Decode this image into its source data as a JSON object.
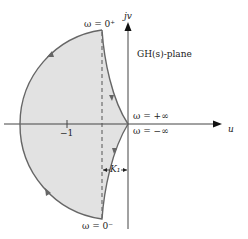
{
  "diagram": {
    "plane_label": "GH(s)-plane",
    "axis_imag_label": "jv",
    "axis_real_label": "u",
    "tick_label": "−1",
    "omega_top": "ω = 0⁺",
    "omega_bottom": "ω = 0⁻",
    "omega_pos_inf": "ω = +∞",
    "omega_neg_inf": "ω = −∞",
    "gap_label": "K₁",
    "colors": {
      "fill": "#e2e2e2",
      "curve": "#666666",
      "axis": "#444444"
    }
  }
}
